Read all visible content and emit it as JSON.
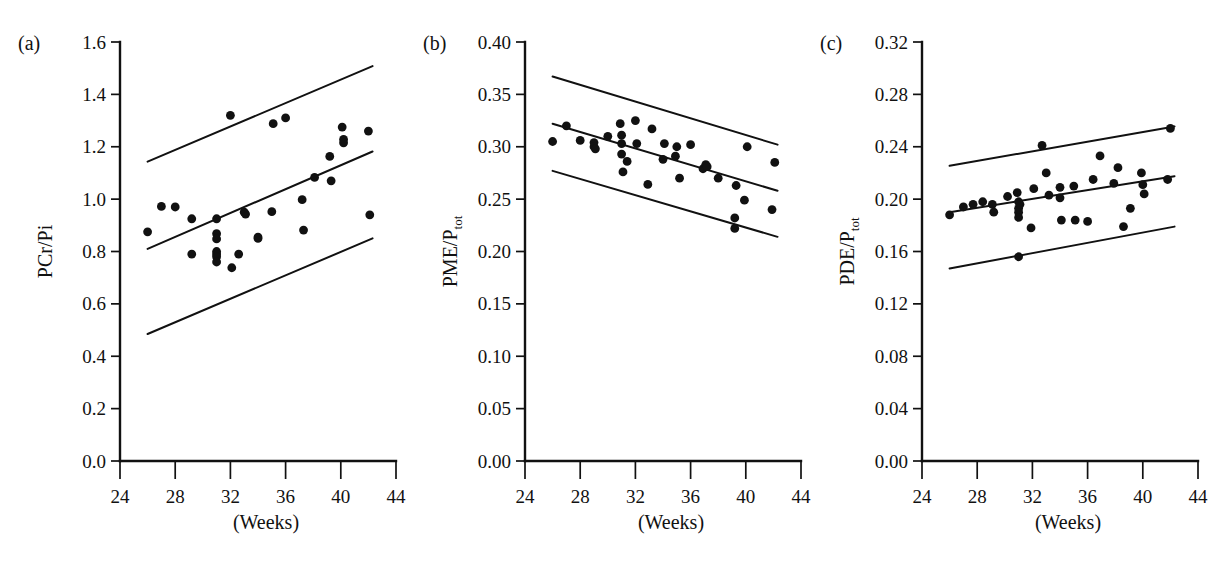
{
  "figure": {
    "background": "#ffffff",
    "ink_color": "#111111",
    "xlabel": "(Weeks)"
  },
  "chart_data": [
    {
      "type": "scatter",
      "panel_label": "(a)",
      "title": "",
      "xlabel": "(Weeks)",
      "ylabel": "PCr/Pi",
      "ylabel_sub": "",
      "xlim": [
        24,
        44
      ],
      "ylim": [
        0.0,
        1.6
      ],
      "xticks": [
        24,
        28,
        32,
        36,
        40,
        44
      ],
      "xticklabels": [
        "24",
        "28",
        "32",
        "36",
        "40",
        "44"
      ],
      "yticks": [
        0.0,
        0.2,
        0.4,
        0.6,
        0.8,
        1.0,
        1.2,
        1.4,
        1.6
      ],
      "yticklabels": [
        "0.0",
        "0.2",
        "0.4",
        "0.6",
        "0.8",
        "1.0",
        "1.2",
        "1.4",
        "1.6"
      ],
      "grid": false,
      "legend": "none",
      "x": [
        26.0,
        27.0,
        28.0,
        29.2,
        29.2,
        31.0,
        31.0,
        31.0,
        31.0,
        31.0,
        31.0,
        31.0,
        32.0,
        32.1,
        32.6,
        33.0,
        33.1,
        34.0,
        34.0,
        35.0,
        35.1,
        36.0,
        37.2,
        37.3,
        38.1,
        39.2,
        39.3,
        40.1,
        40.2,
        40.2,
        42.0,
        42.1
      ],
      "y": [
        0.875,
        0.972,
        0.97,
        0.925,
        0.79,
        0.925,
        0.868,
        0.848,
        0.8,
        0.79,
        0.78,
        0.76,
        1.32,
        0.738,
        0.79,
        0.95,
        0.943,
        0.855,
        0.85,
        0.952,
        1.288,
        1.31,
        0.998,
        0.882,
        1.083,
        1.163,
        1.07,
        1.275,
        1.228,
        1.215,
        1.26,
        0.94
      ],
      "lines": [
        {
          "name": "upper-confidence-band",
          "points": [
            [
              26.0,
              1.143
            ],
            [
              42.3,
              1.508
            ]
          ]
        },
        {
          "name": "regression-line",
          "points": [
            [
              26.0,
              0.81
            ],
            [
              42.3,
              1.182
            ]
          ]
        },
        {
          "name": "lower-confidence-band",
          "points": [
            [
              26.0,
              0.485
            ],
            [
              42.3,
              0.85
            ]
          ]
        }
      ]
    },
    {
      "type": "scatter",
      "panel_label": "(b)",
      "title": "",
      "xlabel": "(Weeks)",
      "ylabel": "PME/P",
      "ylabel_sub": "tot",
      "xlim": [
        24,
        44
      ],
      "ylim": [
        0.0,
        0.4
      ],
      "xticks": [
        24,
        28,
        32,
        36,
        40,
        44
      ],
      "xticklabels": [
        "24",
        "28",
        "32",
        "36",
        "40",
        "44"
      ],
      "yticks": [
        0.0,
        0.05,
        0.1,
        0.15,
        0.2,
        0.25,
        0.3,
        0.35,
        0.4
      ],
      "yticklabels": [
        "0.00",
        "0.05",
        "0.10",
        "0.15",
        "0.20",
        "0.25",
        "0.30",
        "0.35",
        "0.40"
      ],
      "grid": false,
      "legend": "none",
      "x": [
        26.0,
        27.0,
        28.0,
        29.0,
        29.0,
        29.1,
        30.0,
        30.9,
        31.0,
        31.0,
        31.0,
        31.1,
        31.4,
        32.0,
        32.1,
        32.9,
        33.2,
        34.0,
        34.1,
        34.9,
        35.0,
        35.2,
        36.0,
        36.9,
        37.1,
        37.2,
        38.0,
        39.2,
        39.2,
        39.3,
        39.9,
        40.1,
        41.9,
        42.1
      ],
      "y": [
        0.305,
        0.32,
        0.306,
        0.304,
        0.3,
        0.298,
        0.31,
        0.322,
        0.311,
        0.303,
        0.293,
        0.276,
        0.286,
        0.325,
        0.303,
        0.264,
        0.317,
        0.288,
        0.303,
        0.291,
        0.3,
        0.27,
        0.302,
        0.279,
        0.283,
        0.281,
        0.27,
        0.232,
        0.222,
        0.263,
        0.249,
        0.3,
        0.24,
        0.285
      ],
      "lines": [
        {
          "name": "upper-confidence-band",
          "points": [
            [
              26.0,
              0.367
            ],
            [
              42.3,
              0.302
            ]
          ]
        },
        {
          "name": "regression-line",
          "points": [
            [
              26.0,
              0.322
            ],
            [
              42.3,
              0.258
            ]
          ]
        },
        {
          "name": "lower-confidence-band",
          "points": [
            [
              26.0,
              0.277
            ],
            [
              42.3,
              0.214
            ]
          ]
        }
      ]
    },
    {
      "type": "scatter",
      "panel_label": "(c)",
      "title": "",
      "xlabel": "(Weeks)",
      "ylabel": "PDE/P",
      "ylabel_sub": "tot",
      "xlim": [
        24,
        44
      ],
      "ylim": [
        0.0,
        0.32
      ],
      "xticks": [
        24,
        28,
        32,
        36,
        40,
        44
      ],
      "xticklabels": [
        "24",
        "28",
        "32",
        "36",
        "40",
        "44"
      ],
      "yticks": [
        0.0,
        0.04,
        0.08,
        0.12,
        0.16,
        0.2,
        0.24,
        0.28,
        0.32
      ],
      "yticklabels": [
        "0.00",
        "0.04",
        "0.08",
        "0.12",
        "0.16",
        "0.20",
        "0.24",
        "0.28",
        "0.32"
      ],
      "grid": false,
      "legend": "none",
      "x": [
        26.0,
        27.0,
        27.7,
        28.4,
        29.1,
        29.2,
        30.2,
        30.9,
        31.0,
        31.0,
        31.0,
        31.0,
        31.0,
        31.1,
        31.9,
        32.1,
        32.7,
        33.0,
        33.2,
        34.0,
        34.0,
        34.1,
        35.0,
        35.1,
        36.0,
        36.4,
        36.9,
        37.9,
        38.2,
        38.6,
        39.1,
        39.9,
        40.0,
        40.1,
        41.8,
        42.0
      ],
      "y": [
        0.188,
        0.194,
        0.196,
        0.198,
        0.196,
        0.19,
        0.202,
        0.205,
        0.198,
        0.193,
        0.19,
        0.186,
        0.156,
        0.196,
        0.178,
        0.208,
        0.241,
        0.22,
        0.203,
        0.209,
        0.201,
        0.184,
        0.21,
        0.184,
        0.183,
        0.215,
        0.233,
        0.212,
        0.224,
        0.179,
        0.193,
        0.22,
        0.211,
        0.204,
        0.215,
        0.254
      ],
      "lines": [
        {
          "name": "upper-confidence-band",
          "points": [
            [
              26.0,
              0.2255
            ],
            [
              42.3,
              0.2555
            ]
          ]
        },
        {
          "name": "regression-line",
          "points": [
            [
              26.0,
              0.19
            ],
            [
              42.3,
              0.2175
            ]
          ]
        },
        {
          "name": "lower-confidence-band",
          "points": [
            [
              26.0,
              0.147
            ],
            [
              42.3,
              0.179
            ]
          ]
        }
      ]
    }
  ]
}
